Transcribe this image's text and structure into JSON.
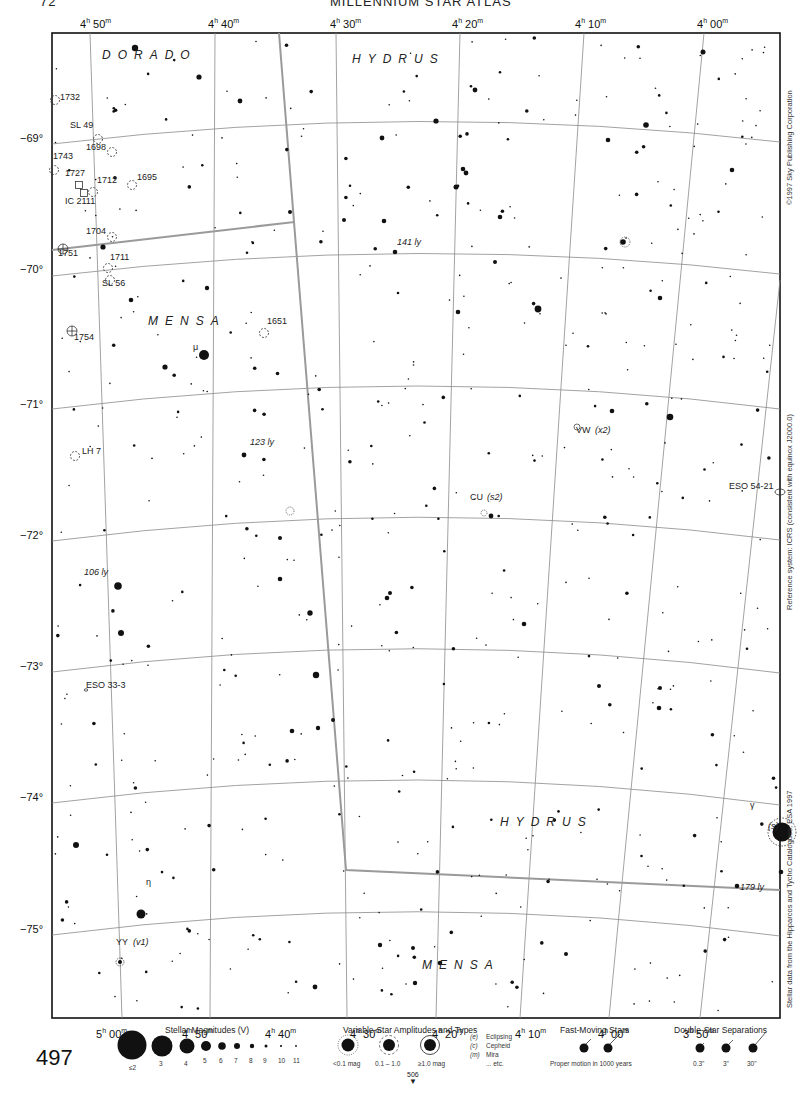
{
  "header": {
    "page_left": "72",
    "title": "MILLENNIUM STAR ATLAS"
  },
  "page_number": "497",
  "next_page": {
    "label": "506",
    "arrow": "▼"
  },
  "ra_top": [
    {
      "h": "4",
      "m": "50",
      "x": 80
    },
    {
      "h": "4",
      "m": "40",
      "x": 208
    },
    {
      "h": "4",
      "m": "30",
      "x": 330
    },
    {
      "h": "4",
      "m": "20",
      "x": 452
    },
    {
      "h": "4",
      "m": "10",
      "x": 575
    },
    {
      "h": "4",
      "m": "00",
      "x": 697
    }
  ],
  "ra_bottom": [
    {
      "h": "5",
      "m": "00",
      "x": 96
    },
    {
      "h": "4",
      "m": "50",
      "x": 182
    },
    {
      "h": "4",
      "m": "40",
      "x": 265
    },
    {
      "h": "4",
      "m": "30",
      "x": 350
    },
    {
      "h": "4",
      "m": "20",
      "x": 432
    },
    {
      "h": "4",
      "m": "10",
      "x": 515
    },
    {
      "h": "4",
      "m": "00",
      "x": 598
    },
    {
      "h": "3",
      "m": "50",
      "x": 683
    }
  ],
  "declinations": [
    {
      "label": "−69°",
      "y": 139
    },
    {
      "label": "−70°",
      "y": 270
    },
    {
      "label": "−71°",
      "y": 405
    },
    {
      "label": "−72°",
      "y": 536
    },
    {
      "label": "−73°",
      "y": 667
    },
    {
      "label": "−74°",
      "y": 798
    },
    {
      "label": "−75°",
      "y": 930
    }
  ],
  "side_text": {
    "copyright": "©1997 Sky Publishing Corporation",
    "reference": "Reference system: ICRS (consistent with equinox J2000.0)",
    "source": "Stellar data from the Hipparcos and Tycho Catalogues, ESA 1997"
  },
  "constellations": [
    {
      "name": "DORADO",
      "x": 102,
      "y": 56
    },
    {
      "name": "HYDRUS",
      "x": 352,
      "y": 60
    },
    {
      "name": "MENSA",
      "x": 148,
      "y": 322
    },
    {
      "name": "HYDRUS",
      "x": 500,
      "y": 823
    },
    {
      "name": "MENSA",
      "x": 422,
      "y": 966
    }
  ],
  "objects": [
    {
      "label": "1732",
      "x": 60,
      "y": 98,
      "type": "cluster"
    },
    {
      "label": "SL 49",
      "x": 70,
      "y": 126,
      "type": "cluster"
    },
    {
      "label": "1698",
      "x": 86,
      "y": 148,
      "type": "cluster"
    },
    {
      "label": "1743",
      "x": 53,
      "y": 157,
      "type": "cluster"
    },
    {
      "label": "1727",
      "x": 65,
      "y": 174,
      "type": "nebula"
    },
    {
      "label": "1712",
      "x": 97,
      "y": 181,
      "type": "cluster"
    },
    {
      "label": "1695",
      "x": 137,
      "y": 178,
      "type": "cluster"
    },
    {
      "label": "IC 2111",
      "x": 65,
      "y": 202,
      "type": "nebula"
    },
    {
      "label": "1704",
      "x": 86,
      "y": 232,
      "type": "cluster"
    },
    {
      "label": "1751",
      "x": 58,
      "y": 254,
      "type": "nebula-cluster"
    },
    {
      "label": "1711",
      "x": 110,
      "y": 258,
      "type": "cluster"
    },
    {
      "label": "SL 56",
      "x": 102,
      "y": 284,
      "type": "cluster"
    },
    {
      "label": "1754",
      "x": 74,
      "y": 338,
      "type": "nebula-cluster"
    },
    {
      "label": "1651",
      "x": 267,
      "y": 322,
      "type": "cluster"
    },
    {
      "label": "LH 7",
      "x": 82,
      "y": 452,
      "type": "cluster"
    },
    {
      "label": "ESO 33-3",
      "x": 86,
      "y": 686,
      "type": "galaxy"
    },
    {
      "label": "ESO 54-21",
      "x": 728,
      "y": 485,
      "type": "galaxy"
    }
  ],
  "star_labels": [
    {
      "label": "μ",
      "x": 193,
      "y": 348,
      "italic": false
    },
    {
      "label": "123 ly",
      "x": 250,
      "y": 443,
      "italic": true
    },
    {
      "label": "141 ly",
      "x": 397,
      "y": 243,
      "italic": true
    },
    {
      "label": "106 ly",
      "x": 84,
      "y": 573,
      "italic": true
    },
    {
      "label": "VW",
      "x": 576,
      "y": 431,
      "italic": false
    },
    {
      "label": "(x2)",
      "x": 595,
      "y": 431,
      "italic": true
    },
    {
      "label": "CU",
      "x": 470,
      "y": 498,
      "italic": false
    },
    {
      "label": "(s2)",
      "x": 487,
      "y": 498,
      "italic": true
    },
    {
      "label": "γ",
      "x": 750,
      "y": 806,
      "italic": false
    },
    {
      "label": "(s)",
      "x": 768,
      "y": 827,
      "italic": true
    },
    {
      "label": "179 ly",
      "x": 740,
      "y": 888,
      "italic": true
    },
    {
      "label": "η",
      "x": 146,
      "y": 883,
      "italic": false
    },
    {
      "label": "YY",
      "x": 116,
      "y": 943,
      "italic": false
    },
    {
      "label": "(v1)",
      "x": 133,
      "y": 943,
      "italic": true
    }
  ],
  "legend": {
    "magnitudes": {
      "title": "Stellar Magnitudes (V)",
      "labels": [
        "≤2",
        "3",
        "4",
        "5",
        "6",
        "7",
        "8",
        "9",
        "10",
        "11"
      ]
    },
    "variables": {
      "title": "Variable-Star Amplitudes and Types",
      "labels": [
        "<0.1 mag",
        "0.1 – 1.0",
        "≥1.0 mag"
      ],
      "types": [
        {
          "code": "(e)",
          "name": "Eclipsing"
        },
        {
          "code": "(c)",
          "name": "Cepheid"
        },
        {
          "code": "(m)",
          "name": "Mira"
        },
        {
          "code": "",
          "name": "... etc."
        }
      ]
    },
    "fast_moving": {
      "title": "Fast-Moving Stars",
      "caption": "Proper motion in 1000 years"
    },
    "doubles": {
      "title": "Double-Star Separations",
      "labels": [
        "0.3\"",
        "3\"",
        "30\""
      ]
    }
  },
  "colors": {
    "ink": "#111111",
    "grid": "#8a8a8a",
    "boundary": "#9a9a9a",
    "paper": "#ffffff"
  },
  "bright_stars": [
    [
      135,
      48,
      3.2
    ],
    [
      199,
      77,
      2.6
    ],
    [
      240,
      101,
      2.4
    ],
    [
      475,
      90,
      2.4
    ],
    [
      703,
      52,
      2.5
    ],
    [
      436,
      121,
      2.6
    ],
    [
      646,
      125,
      2.8
    ],
    [
      204,
      355,
      5
    ],
    [
      103,
      247,
      2.6
    ],
    [
      131,
      300,
      2.3
    ],
    [
      165,
      367,
      2.6
    ],
    [
      538,
      309,
      3.4
    ],
    [
      612,
      411,
      2.3
    ],
    [
      670,
      417,
      3.3
    ],
    [
      456,
      187,
      2.5
    ],
    [
      207,
      288,
      2.2
    ],
    [
      118,
      586,
      3.8
    ],
    [
      121,
      633,
      3.0
    ],
    [
      316,
      675,
      3.2
    ],
    [
      310,
      613,
      2.7
    ],
    [
      387,
      598,
      2.3
    ],
    [
      524,
      624,
      2.3
    ],
    [
      280,
      579,
      2.3
    ],
    [
      782,
      832,
      9.5
    ],
    [
      141,
      914,
      4.5
    ],
    [
      76,
      845,
      3.0
    ],
    [
      463,
      169,
      2.3
    ],
    [
      466,
      173,
      2.4
    ],
    [
      500,
      217,
      2.3
    ],
    [
      382,
      138,
      2.4
    ],
    [
      458,
      312,
      2.3
    ],
    [
      384,
      221,
      2.3
    ],
    [
      395,
      252,
      2.3
    ],
    [
      344,
      220,
      2.0
    ],
    [
      290,
      212,
      2.0
    ],
    [
      495,
      262,
      2.0
    ],
    [
      660,
      298,
      2.3
    ],
    [
      732,
      170,
      2.3
    ],
    [
      244,
      455,
      2.4
    ],
    [
      491,
      516,
      2.4
    ],
    [
      608,
      140,
      2.3
    ],
    [
      623,
      242,
      2.8
    ],
    [
      318,
      728,
      2.2
    ],
    [
      333,
      720,
      2.0
    ],
    [
      737,
      886,
      2.3
    ],
    [
      781,
      872,
      2.3
    ],
    [
      659,
      708,
      2.3
    ],
    [
      660,
      688,
      2.0
    ],
    [
      380,
      945,
      2.2
    ],
    [
      415,
      983,
      2.2
    ],
    [
      440,
      963,
      2.3
    ],
    [
      566,
      954,
      2.0
    ],
    [
      315,
      987,
      2.4
    ],
    [
      413,
      948,
      2.0
    ],
    [
      292,
      731,
      2.3
    ],
    [
      599,
      686,
      2.0
    ],
    [
      280,
      538,
      2.0
    ],
    [
      390,
      593,
      2.0
    ]
  ]
}
